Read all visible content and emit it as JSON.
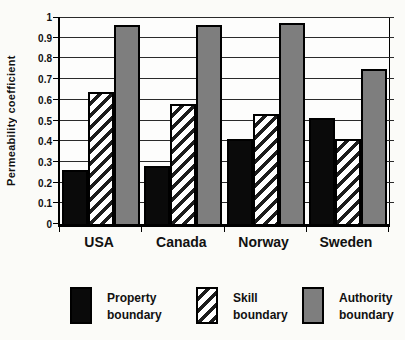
{
  "chart_data": {
    "type": "bar",
    "title": "",
    "xlabel": "",
    "ylabel": "Permeability coefficient",
    "categories": [
      "USA",
      "Canada",
      "Norway",
      "Sweden"
    ],
    "series": [
      {
        "name": "Property boundary",
        "values": [
          0.26,
          0.28,
          0.41,
          0.51
        ],
        "fill": "#0a0a0a",
        "hatch": false
      },
      {
        "name": "Skill boundary",
        "values": [
          0.64,
          0.58,
          0.53,
          0.41
        ],
        "fill": "#ffffff",
        "hatch": true
      },
      {
        "name": "Authority boundary",
        "values": [
          0.96,
          0.96,
          0.97,
          0.75
        ],
        "fill": "#7e7e7e",
        "hatch": false
      }
    ],
    "ylim": [
      0,
      1
    ],
    "yticks": [
      "1",
      "0.9",
      "0.8",
      "0.7",
      "0.6",
      "0.5",
      "0.4",
      "0.3",
      "0.2",
      "0.1",
      "0"
    ],
    "grid": true,
    "legend_position": "bottom",
    "colors": {
      "outline": "#000000",
      "gridline": "#2a2a2a",
      "bar_black": "#0a0a0a",
      "bar_gray": "#7e7e7e",
      "hatch_bg": "#ffffff",
      "hatch_stripe": "#1c1c1c"
    }
  }
}
